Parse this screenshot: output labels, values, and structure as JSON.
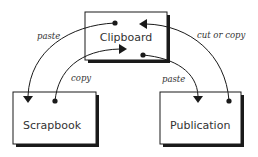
{
  "diagram": {
    "nodes": [
      {
        "id": "clipboard",
        "label": "Clipboard",
        "x": 85,
        "y": 12,
        "w": 82,
        "h": 48,
        "label_x": 126,
        "label_y": 41
      },
      {
        "id": "scrapbook",
        "label": "Scrapbook",
        "x": 13,
        "y": 92,
        "w": 83,
        "h": 52,
        "label_x": 23,
        "label_y": 129
      },
      {
        "id": "publication",
        "label": "Publication",
        "x": 160,
        "y": 92,
        "w": 81,
        "h": 52,
        "label_x": 170,
        "label_y": 129
      }
    ],
    "edges": [
      {
        "id": "paste-to-scrapbook",
        "label": "paste",
        "from": "clipboard",
        "to": "scrapbook"
      },
      {
        "id": "copy-to-clipboard",
        "label": "copy",
        "from": "scrapbook",
        "to": "clipboard"
      },
      {
        "id": "cut-or-copy-to-clipboard",
        "label": "cut or copy",
        "from": "publication",
        "to": "clipboard"
      },
      {
        "id": "paste-to-publication",
        "label": "paste",
        "from": "clipboard",
        "to": "publication"
      }
    ]
  },
  "colors": {
    "stroke": "#1a1a1a",
    "shadow": "#1a1a1a",
    "background": "#ffffff"
  }
}
